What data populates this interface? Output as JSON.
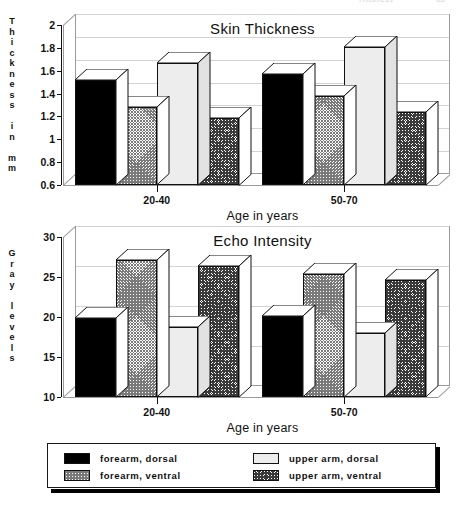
{
  "artifact": {
    "left_text": "Thickness",
    "right_text": "dB"
  },
  "chart_data": [
    {
      "type": "bar",
      "title": "Skin Thickness",
      "xlabel": "Age in years",
      "ylabel": "Thickness in mm",
      "ylabel_lines": [
        "T",
        "h",
        "i",
        "c",
        "k",
        "n",
        "e",
        "s",
        "s",
        "",
        "i",
        "n",
        "",
        "m",
        "m"
      ],
      "categories": [
        "20-40",
        "50-70"
      ],
      "ylim": [
        0.6,
        2
      ],
      "yticks": [
        0.6,
        0.8,
        1,
        1.2,
        1.4,
        1.6,
        1.8,
        2
      ],
      "ytick_labels": [
        "0.6",
        "0.8",
        "1",
        "1.2",
        "1.4",
        "1.6",
        "1.8",
        "2"
      ],
      "grid": true,
      "legend_position": "below-figure",
      "series": [
        {
          "name": "forearm, dorsal",
          "pattern": "solid-black",
          "values": [
            1.52,
            1.57
          ]
        },
        {
          "name": "forearm, ventral",
          "pattern": "hatch-light",
          "values": [
            1.28,
            1.38
          ]
        },
        {
          "name": "upper arm, dorsal",
          "pattern": "solid-light",
          "values": [
            1.67,
            1.81
          ]
        },
        {
          "name": "upper arm, ventral",
          "pattern": "hatch-dark",
          "values": [
            1.19,
            1.24
          ]
        }
      ]
    },
    {
      "type": "bar",
      "title": "Echo Intensity",
      "xlabel": "Age in years",
      "ylabel": "Gray levels",
      "ylabel_lines": [
        "G",
        "r",
        "a",
        "y",
        "",
        "l",
        "e",
        "v",
        "e",
        "l",
        "s"
      ],
      "categories": [
        "20-40",
        "50-70"
      ],
      "ylim": [
        10,
        30
      ],
      "yticks": [
        10,
        15,
        20,
        25,
        30
      ],
      "ytick_labels": [
        "10",
        "15",
        "20",
        "25",
        "30"
      ],
      "grid": true,
      "legend_position": "below-figure",
      "series": [
        {
          "name": "forearm, dorsal",
          "pattern": "solid-black",
          "values": [
            19.9,
            20.1
          ]
        },
        {
          "name": "forearm, ventral",
          "pattern": "hatch-light",
          "values": [
            27.1,
            25.4
          ]
        },
        {
          "name": "upper arm, dorsal",
          "pattern": "solid-light",
          "values": [
            18.8,
            18.0
          ]
        },
        {
          "name": "upper arm, ventral",
          "pattern": "hatch-dark",
          "values": [
            26.4,
            24.6
          ]
        }
      ]
    }
  ],
  "legend": {
    "items": [
      {
        "label": "forearm, dorsal",
        "pattern": "solid-black"
      },
      {
        "label": "forearm, ventral",
        "pattern": "hatch-light"
      },
      {
        "label": "upper arm, dorsal",
        "pattern": "solid-light"
      },
      {
        "label": "upper arm, ventral",
        "pattern": "hatch-dark"
      }
    ]
  },
  "colors": {
    "black": "#000000",
    "light_gray": "#ededed",
    "hatch_light": "#7a7a7a",
    "hatch_dark": "#3a3a3a",
    "grid": "#d3d3d3",
    "axis": "#111111"
  }
}
